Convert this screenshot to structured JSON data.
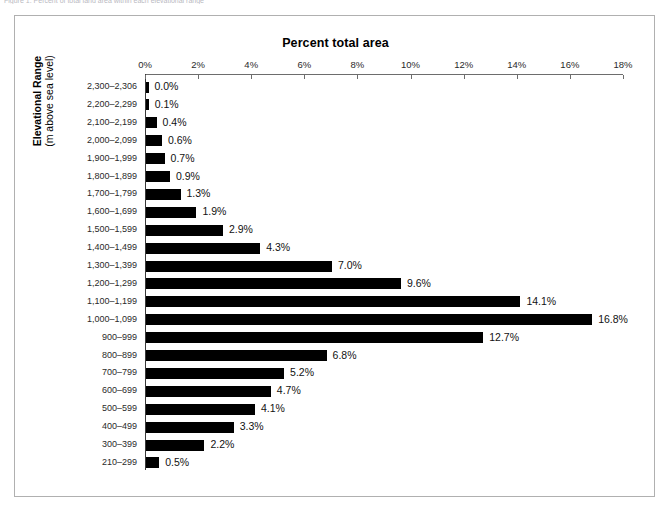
{
  "caption": {
    "text": "Figure 1. Percent of total land area within each elevational range"
  },
  "chart_data": {
    "type": "bar",
    "orientation": "horizontal",
    "title": "Percent total area",
    "xlabel": "Percent total area",
    "ylabel": "Elevational Range",
    "ylabel_line2": "(m above sea level)",
    "xlim": [
      0,
      18
    ],
    "xtick_values": [
      0,
      2,
      4,
      6,
      8,
      10,
      12,
      14,
      16,
      18
    ],
    "xtick_labels": [
      "0%",
      "2%",
      "4%",
      "6%",
      "8%",
      "10%",
      "12%",
      "14%",
      "16%",
      "18%"
    ],
    "grid": false,
    "legend": false,
    "bar_color": "#000000",
    "categories": [
      "2,300–2,306",
      "2,200–2,299",
      "2,100–2,199",
      "2,000–2,099",
      "1,900–1,999",
      "1,800–1,899",
      "1,700–1,799",
      "1,600–1,699",
      "1,500–1,599",
      "1,400–1,499",
      "1,300–1,399",
      "1,200–1,299",
      "1,100–1,199",
      "1,000–1,099",
      "900–999",
      "800–899",
      "700–799",
      "600–699",
      "500–599",
      "400–499",
      "300–399",
      "210–299"
    ],
    "values": [
      0.0,
      0.1,
      0.4,
      0.6,
      0.7,
      0.9,
      1.3,
      1.9,
      2.9,
      4.3,
      7.0,
      9.6,
      14.1,
      16.8,
      12.7,
      6.8,
      5.2,
      4.7,
      4.1,
      3.3,
      2.2,
      0.5
    ],
    "data_labels": [
      "0.0%",
      "0.1%",
      "0.4%",
      "0.6%",
      "0.7%",
      "0.9%",
      "1.3%",
      "1.9%",
      "2.9%",
      "4.3%",
      "7.0%",
      "9.6%",
      "14.1%",
      "16.8%",
      "12.7%",
      "6.8%",
      "5.2%",
      "4.7%",
      "4.1%",
      "3.3%",
      "2.2%",
      "0.5%"
    ]
  }
}
